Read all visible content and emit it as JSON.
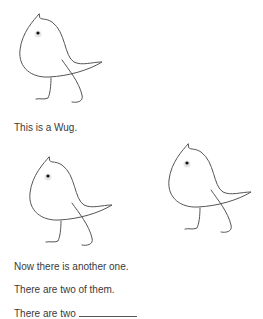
{
  "figures": [
    {
      "name": "wug-1",
      "label": "wug drawing"
    },
    {
      "name": "wug-2",
      "label": "wug drawing"
    },
    {
      "name": "wug-3",
      "label": "wug drawing"
    }
  ],
  "text": {
    "line1": "This is a Wug.",
    "line2": "Now there is another one.",
    "line3": "There are two of them.",
    "line4_prefix": "There are two"
  },
  "colors": {
    "stroke": "#555555",
    "text": "#3a3a3a"
  }
}
